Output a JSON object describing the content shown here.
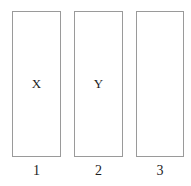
{
  "diagram": {
    "type": "column-boxes",
    "background_color": "#ffffff",
    "border_color": "#9a9a9a",
    "text_color": "#1d1d1d",
    "columns": [
      {
        "letter": "X",
        "label": "1"
      },
      {
        "letter": "Y",
        "label": "2"
      },
      {
        "letter": "",
        "label": "3"
      }
    ]
  }
}
